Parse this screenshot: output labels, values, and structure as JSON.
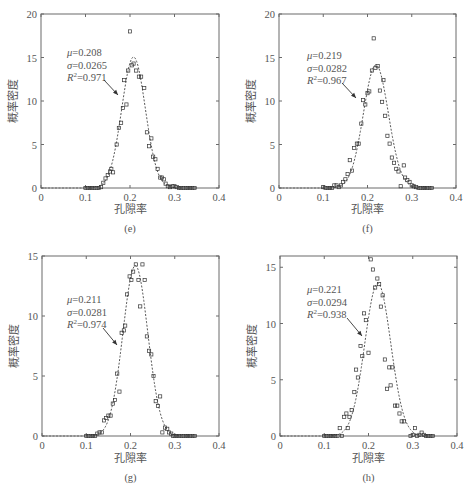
{
  "figure": {
    "xlabel": "孔隙率",
    "ylabel": "概率密度"
  },
  "chart_data": [
    {
      "type": "scatter",
      "panel": "(e)",
      "xlabel": "孔隙率",
      "ylabel": "概率密度",
      "xlim": [
        0,
        0.4
      ],
      "ylim": [
        0,
        20
      ],
      "xticks": [
        0,
        0.1,
        0.2,
        0.3,
        0.4
      ],
      "yticks": [
        0,
        5,
        10,
        15,
        20
      ],
      "annotation": {
        "mu": "0.208",
        "sigma": "0.0265",
        "r2": "0.971"
      },
      "fit": {
        "mu": 0.208,
        "sigma": 0.0265
      },
      "frame": {
        "x0": 41,
        "x1": 219,
        "y0": 14,
        "y1": 188
      },
      "annotation_pos": {
        "x": 67,
        "y": 56
      },
      "arrow": {
        "x1": 104,
        "y1": 80,
        "x2": 118,
        "y2": 95
      },
      "caption_y": 232,
      "xlabel_y": 213,
      "points": [
        [
          0.1,
          0
        ],
        [
          0.105,
          0
        ],
        [
          0.11,
          0
        ],
        [
          0.115,
          0
        ],
        [
          0.12,
          0
        ],
        [
          0.125,
          0
        ],
        [
          0.13,
          0
        ],
        [
          0.135,
          0.1
        ],
        [
          0.14,
          0.6
        ],
        [
          0.145,
          1.1
        ],
        [
          0.15,
          1.5
        ],
        [
          0.155,
          1.9
        ],
        [
          0.158,
          2.2
        ],
        [
          0.162,
          1.8
        ],
        [
          0.17,
          5.0
        ],
        [
          0.175,
          6.9
        ],
        [
          0.18,
          7.5
        ],
        [
          0.184,
          9.2
        ],
        [
          0.187,
          12.4
        ],
        [
          0.192,
          9.6
        ],
        [
          0.196,
          13.5
        ],
        [
          0.2,
          18.0
        ],
        [
          0.204,
          14.1
        ],
        [
          0.208,
          14.3
        ],
        [
          0.214,
          13.5
        ],
        [
          0.22,
          12.8
        ],
        [
          0.225,
          12.8
        ],
        [
          0.232,
          11.5
        ],
        [
          0.238,
          6.4
        ],
        [
          0.243,
          4.8
        ],
        [
          0.248,
          5.7
        ],
        [
          0.252,
          3.6
        ],
        [
          0.257,
          3.3
        ],
        [
          0.262,
          2.2
        ],
        [
          0.268,
          1.2
        ],
        [
          0.272,
          1.2
        ],
        [
          0.276,
          1.0
        ],
        [
          0.28,
          0.5
        ],
        [
          0.285,
          0.2
        ],
        [
          0.29,
          0.1
        ],
        [
          0.295,
          0.2
        ],
        [
          0.3,
          0.2
        ],
        [
          0.305,
          0.1
        ],
        [
          0.31,
          0
        ],
        [
          0.315,
          0
        ],
        [
          0.32,
          0
        ],
        [
          0.325,
          0
        ],
        [
          0.33,
          0
        ],
        [
          0.335,
          0
        ],
        [
          0.34,
          0
        ],
        [
          0.345,
          0
        ]
      ]
    },
    {
      "type": "scatter",
      "panel": "(f)",
      "xlabel": "孔隙率",
      "ylabel": "概率密度",
      "xlim": [
        0,
        0.4
      ],
      "ylim": [
        0,
        20
      ],
      "xticks": [
        0,
        0.1,
        0.2,
        0.3,
        0.4
      ],
      "yticks": [
        0,
        5,
        10,
        15,
        20
      ],
      "annotation": {
        "mu": "0.219",
        "sigma": "0.0282",
        "r2": "0.967"
      },
      "fit": {
        "mu": 0.219,
        "sigma": 0.0282
      },
      "frame": {
        "x0": 279,
        "x1": 456,
        "y0": 14,
        "y1": 188
      },
      "annotation_pos": {
        "x": 307,
        "y": 59
      },
      "arrow": {
        "x1": 342,
        "y1": 83,
        "x2": 356,
        "y2": 98
      },
      "caption_y": 232,
      "xlabel_y": 213,
      "points": [
        [
          0.1,
          0.1
        ],
        [
          0.105,
          0
        ],
        [
          0.11,
          0
        ],
        [
          0.115,
          0
        ],
        [
          0.12,
          0
        ],
        [
          0.125,
          0.3
        ],
        [
          0.13,
          0.3
        ],
        [
          0.135,
          0.1
        ],
        [
          0.14,
          0.3
        ],
        [
          0.145,
          0.7
        ],
        [
          0.15,
          1.0
        ],
        [
          0.155,
          1.6
        ],
        [
          0.16,
          3.2
        ],
        [
          0.165,
          2.0
        ],
        [
          0.17,
          4.6
        ],
        [
          0.176,
          5.1
        ],
        [
          0.18,
          5.1
        ],
        [
          0.186,
          7.4
        ],
        [
          0.19,
          10.1
        ],
        [
          0.195,
          9.6
        ],
        [
          0.2,
          10.9
        ],
        [
          0.204,
          11.1
        ],
        [
          0.21,
          13.5
        ],
        [
          0.214,
          17.2
        ],
        [
          0.218,
          13.8
        ],
        [
          0.223,
          14.0
        ],
        [
          0.228,
          11.2
        ],
        [
          0.233,
          9.9
        ],
        [
          0.236,
          12.4
        ],
        [
          0.24,
          8.3
        ],
        [
          0.245,
          6.0
        ],
        [
          0.25,
          5.1
        ],
        [
          0.255,
          3.5
        ],
        [
          0.26,
          2.9
        ],
        [
          0.265,
          2.2
        ],
        [
          0.27,
          1.9
        ],
        [
          0.275,
          0.2
        ],
        [
          0.282,
          2.6
        ],
        [
          0.285,
          1.2
        ],
        [
          0.29,
          0.9
        ],
        [
          0.295,
          0.7
        ],
        [
          0.3,
          0.3
        ],
        [
          0.305,
          0.2
        ],
        [
          0.31,
          0.1
        ],
        [
          0.315,
          0
        ],
        [
          0.32,
          0
        ],
        [
          0.325,
          0
        ],
        [
          0.33,
          0
        ],
        [
          0.335,
          0
        ],
        [
          0.34,
          0
        ],
        [
          0.345,
          0
        ]
      ]
    },
    {
      "type": "scatter",
      "panel": "(g)",
      "xlabel": "孔隙率",
      "ylabel": "概率密度",
      "xlim": [
        0,
        0.4
      ],
      "ylim": [
        0,
        15
      ],
      "xticks": [
        0,
        0.1,
        0.2,
        0.3,
        0.4
      ],
      "yticks": [
        0,
        5,
        10,
        15
      ],
      "annotation": {
        "mu": "0.211",
        "sigma": "0.0281",
        "r2": "0.974"
      },
      "fit": {
        "mu": 0.211,
        "sigma": 0.0281
      },
      "frame": {
        "x0": 42,
        "x1": 219,
        "y0": 256,
        "y1": 436
      },
      "annotation_pos": {
        "x": 67,
        "y": 303
      },
      "arrow": {
        "x1": 103,
        "y1": 328,
        "x2": 117,
        "y2": 345
      },
      "caption_y": 481,
      "xlabel_y": 462,
      "points": [
        [
          0.1,
          0
        ],
        [
          0.105,
          0
        ],
        [
          0.11,
          0
        ],
        [
          0.115,
          0
        ],
        [
          0.12,
          0
        ],
        [
          0.125,
          0.2
        ],
        [
          0.13,
          0.3
        ],
        [
          0.135,
          0.3
        ],
        [
          0.14,
          1.3
        ],
        [
          0.145,
          1.5
        ],
        [
          0.15,
          1.7
        ],
        [
          0.155,
          1.7
        ],
        [
          0.16,
          2.7
        ],
        [
          0.165,
          3.0
        ],
        [
          0.17,
          5.2
        ],
        [
          0.175,
          3.7
        ],
        [
          0.18,
          8.6
        ],
        [
          0.185,
          8.8
        ],
        [
          0.188,
          9.2
        ],
        [
          0.192,
          11.8
        ],
        [
          0.198,
          13.3
        ],
        [
          0.202,
          13.0
        ],
        [
          0.206,
          13.7
        ],
        [
          0.212,
          14.3
        ],
        [
          0.218,
          13.0
        ],
        [
          0.222,
          10.8
        ],
        [
          0.227,
          14.3
        ],
        [
          0.232,
          13.0
        ],
        [
          0.237,
          8.3
        ],
        [
          0.242,
          7.1
        ],
        [
          0.247,
          6.8
        ],
        [
          0.252,
          5.0
        ],
        [
          0.257,
          2.9
        ],
        [
          0.262,
          2.5
        ],
        [
          0.267,
          3.3
        ],
        [
          0.272,
          0.3
        ],
        [
          0.278,
          0.7
        ],
        [
          0.283,
          0.6
        ],
        [
          0.287,
          0.3
        ],
        [
          0.292,
          0.2
        ],
        [
          0.296,
          0
        ],
        [
          0.3,
          0
        ],
        [
          0.305,
          0
        ],
        [
          0.31,
          0
        ],
        [
          0.315,
          0
        ],
        [
          0.32,
          0
        ],
        [
          0.325,
          0
        ],
        [
          0.33,
          0
        ],
        [
          0.335,
          0
        ],
        [
          0.34,
          0
        ],
        [
          0.345,
          0
        ]
      ]
    },
    {
      "type": "scatter",
      "panel": "(h)",
      "xlabel": "孔隙率",
      "ylabel": "概率密度",
      "xlim": [
        0,
        0.4
      ],
      "ylim": [
        0,
        16
      ],
      "xticks": [
        0,
        0.1,
        0.2,
        0.3,
        0.4
      ],
      "yticks": [
        0,
        5,
        10,
        15
      ],
      "annotation": {
        "mu": "0.221",
        "sigma": "0.0294",
        "r2": "0.938"
      },
      "fit": {
        "mu": 0.221,
        "sigma": 0.0294
      },
      "frame": {
        "x0": 280,
        "x1": 457,
        "y0": 256,
        "y1": 436
      },
      "annotation_pos": {
        "x": 307,
        "y": 293
      },
      "arrow": {
        "x1": 347,
        "y1": 318,
        "x2": 362,
        "y2": 336
      },
      "caption_y": 481,
      "xlabel_y": 462,
      "points": [
        [
          0.1,
          0
        ],
        [
          0.105,
          0
        ],
        [
          0.11,
          0
        ],
        [
          0.115,
          0
        ],
        [
          0.12,
          0
        ],
        [
          0.125,
          0
        ],
        [
          0.13,
          0
        ],
        [
          0.135,
          0.7
        ],
        [
          0.14,
          0
        ],
        [
          0.145,
          1.7
        ],
        [
          0.15,
          2.0
        ],
        [
          0.153,
          0.7
        ],
        [
          0.157,
          1.7
        ],
        [
          0.162,
          2.3
        ],
        [
          0.168,
          3.9
        ],
        [
          0.172,
          5.9
        ],
        [
          0.176,
          5.2
        ],
        [
          0.182,
          8.0
        ],
        [
          0.186,
          7.1
        ],
        [
          0.19,
          10.9
        ],
        [
          0.194,
          10.3
        ],
        [
          0.2,
          7.4
        ],
        [
          0.205,
          15.7
        ],
        [
          0.21,
          14.8
        ],
        [
          0.215,
          13.2
        ],
        [
          0.22,
          14.0
        ],
        [
          0.224,
          13.5
        ],
        [
          0.228,
          11.5
        ],
        [
          0.232,
          12.5
        ],
        [
          0.237,
          6.8
        ],
        [
          0.242,
          4.2
        ],
        [
          0.247,
          6.1
        ],
        [
          0.25,
          4.5
        ],
        [
          0.254,
          6.1
        ],
        [
          0.26,
          2.7
        ],
        [
          0.265,
          2.7
        ],
        [
          0.27,
          2.0
        ],
        [
          0.275,
          1.3
        ],
        [
          0.28,
          1.3
        ],
        [
          0.295,
          0
        ],
        [
          0.3,
          0.1
        ],
        [
          0.305,
          0.7
        ],
        [
          0.31,
          0
        ],
        [
          0.315,
          0.1
        ],
        [
          0.32,
          0.3
        ],
        [
          0.325,
          0.1
        ],
        [
          0.33,
          0
        ],
        [
          0.335,
          0
        ],
        [
          0.34,
          0
        ],
        [
          0.345,
          0
        ]
      ]
    }
  ]
}
